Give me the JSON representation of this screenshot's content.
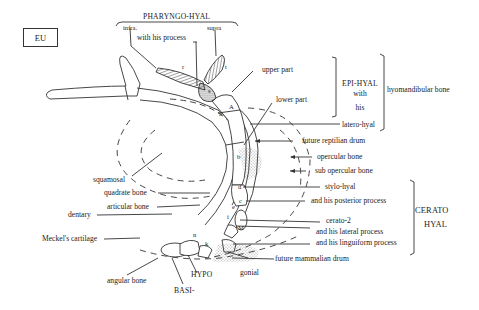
{
  "figure": {
    "badge": "EU",
    "group_labels": {
      "pharyngo_hyal": "PHARYNGO-HYAL",
      "epi_hyal": "EPI-HYAL",
      "epi_hyal_with": "with",
      "epi_hyal_his": "his",
      "hyomandibular": "hyomandibular bone",
      "cerato": "CERATO",
      "hyal": "HYAL",
      "hypo": "HYPO",
      "basi": "BASI-"
    },
    "labels": {
      "infra": "infra.",
      "supra": "supra",
      "with_his_process": "with his process",
      "upper_part": "upper part",
      "lower_part": "lower part",
      "latero_hyal": "latero-hyal",
      "future_reptilian_drum": "future reptilian drum",
      "opercular_bone": "opercular bone",
      "sub_opercular_bone": "sub opercular bone",
      "stylo_hyal": "stylo-hyal",
      "posterior_process": "and his posterior process",
      "cerato_2": "cerato-2",
      "lateral_process": "and his lateral process",
      "linguiform_process": "and his linguiform process",
      "future_mammalian_drum": "future mammalian drum",
      "gonial": "gonial",
      "squamosal": "squamosal",
      "quadrate_bone": "quadrate  bone",
      "articular_bone": "articular bone",
      "dentary": "dentary",
      "meckels_cartilage": "Meckel's cartilage",
      "angular_bone": "angular bone"
    },
    "letters": {
      "r": "r",
      "t": "t",
      "s": "s",
      "A": "A",
      "a": "a",
      "b": "b",
      "c": "c",
      "d": "d",
      "e": "e",
      "i": "i",
      "M": "M",
      "n": "n",
      "k": "k"
    }
  }
}
